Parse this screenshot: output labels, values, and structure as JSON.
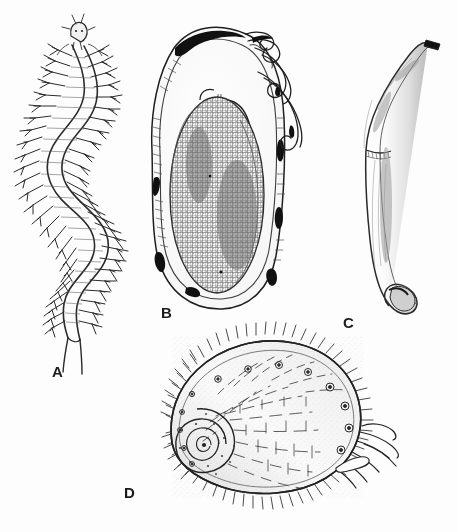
{
  "plate": {
    "title": "Scientific illustration plate of marine invertebrates",
    "background_color": "#fdfdfd",
    "ink_color": "#1a1a1a",
    "width": 457,
    "height": 532,
    "style": "pen-and-ink stipple line drawing",
    "labels": [
      {
        "id": "A",
        "text": "A",
        "x": 52,
        "y": 364,
        "subject": "polychaete-worm",
        "description": "Sinuous segmented polychaete worm in dorsal view with head appendages, paired parapodia bearing chaetae along both sides, and two terminal anal cirri"
      },
      {
        "id": "B",
        "text": "B",
        "x": 161,
        "y": 305,
        "subject": "egg-capsule",
        "description": "Elongate oval egg capsule enclosing a dense granular egg mass, with two long sinuous tendrils extending from the upper end and dark pigmented patches on the capsule wall"
      },
      {
        "id": "C",
        "text": "C",
        "x": 343,
        "y": 315,
        "subject": "sipunculan-worm",
        "description": "Curved club-shaped unsegmented worm with slender introvert at upper end and swollen stippled trunk tapering to a blunt posterior tip"
      },
      {
        "id": "D",
        "text": "D",
        "x": 124,
        "y": 485,
        "subject": "limpet-shell",
        "description": "Broadly oval limpet-like shell in lateral view with coiled spiral apex at lower left, radiating dashed sculpture lines, scattered ringed tubercles, a dense fringe of marginal bristles, and tentacle-like projections at the right posterior margin"
      }
    ]
  }
}
